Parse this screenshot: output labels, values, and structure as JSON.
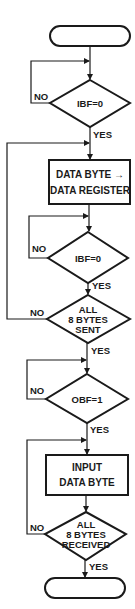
{
  "diagram": {
    "type": "flowchart",
    "colors": {
      "ink": "#1a1a1a",
      "background": "#ffffff"
    },
    "nodes": {
      "start": {
        "kind": "terminal",
        "label": ""
      },
      "d1": {
        "kind": "decision",
        "label": "IBF=0",
        "no_label": "NO",
        "yes_label": "YES"
      },
      "p1": {
        "kind": "process",
        "line1": "DATA BYTE →",
        "line2": "DATA REGISTER"
      },
      "d2": {
        "kind": "decision",
        "label": "IBF=0",
        "no_label": "NO",
        "yes_label": "YES"
      },
      "d3": {
        "kind": "decision",
        "line1": "ALL",
        "line2": "8 BYTES",
        "line3": "SENT",
        "no_label": "NO",
        "yes_label": "YES"
      },
      "d4": {
        "kind": "decision",
        "label": "OBF=1",
        "no_label": "NO",
        "yes_label": "YES"
      },
      "p2": {
        "kind": "process",
        "line1": "INPUT",
        "line2": "DATA BYTE"
      },
      "d5": {
        "kind": "decision",
        "line1": "ALL",
        "line2": "8 BYTES",
        "line3": "RECEIVED",
        "no_label": "NO",
        "yes_label": "YES"
      },
      "end": {
        "kind": "terminal",
        "label": ""
      }
    },
    "edges": [
      {
        "from": "start",
        "to": "d1"
      },
      {
        "from": "d1",
        "to": "d1",
        "label": "NO"
      },
      {
        "from": "d1",
        "to": "p1",
        "label": "YES"
      },
      {
        "from": "p1",
        "to": "d2"
      },
      {
        "from": "d2",
        "to": "d2",
        "label": "NO"
      },
      {
        "from": "d2",
        "to": "d3",
        "label": "YES"
      },
      {
        "from": "d3",
        "to": "p1",
        "label": "NO"
      },
      {
        "from": "d3",
        "to": "d4",
        "label": "YES"
      },
      {
        "from": "d4",
        "to": "d4",
        "label": "NO"
      },
      {
        "from": "d4",
        "to": "p2",
        "label": "YES"
      },
      {
        "from": "p2",
        "to": "d5"
      },
      {
        "from": "d5",
        "to": "p2",
        "label": "NO"
      },
      {
        "from": "d5",
        "to": "end",
        "label": "YES"
      }
    ]
  }
}
